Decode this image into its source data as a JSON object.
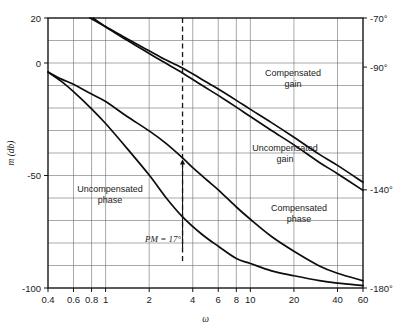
{
  "chart_data": {
    "type": "line",
    "title": "",
    "subtitle": "",
    "xlabel": "ω",
    "ylabel": "m (db)",
    "y2label": "",
    "xscale": "log",
    "xlim": [
      0.4,
      60
    ],
    "ylim": [
      -100,
      20
    ],
    "y2lim": [
      -180,
      -70
    ],
    "grid": true,
    "legend_position": "inline-annotations",
    "x_tick_labels": [
      "0.4",
      "0.6",
      "0.8",
      "1",
      "2",
      "4",
      "6",
      "8",
      "10",
      "20",
      "40",
      "60"
    ],
    "x_tick_values": [
      0.4,
      0.6,
      0.8,
      1,
      2,
      4,
      6,
      8,
      10,
      20,
      40,
      60
    ],
    "x_gridline_values": [
      0.6,
      0.8,
      1,
      2,
      4,
      6,
      8,
      10,
      20,
      40
    ],
    "y_tick_labels": [
      "20",
      "0",
      "-50",
      "-100"
    ],
    "y_tick_values": [
      20,
      0,
      -50,
      -100
    ],
    "y_gridline_values": [
      10,
      0,
      -10,
      -20,
      -30,
      -40,
      -50,
      -60,
      -70,
      -80,
      -90
    ],
    "y2_tick_labels": [
      "-70°",
      "-90°",
      "-140°",
      "-180°"
    ],
    "y2_tick_values": [
      -70,
      -90,
      -140,
      -180
    ],
    "annotations": [
      {
        "name": "compensated-gain",
        "text_line1": "Compensated",
        "text_line2": "gain",
        "x": 293,
        "y": 76
      },
      {
        "name": "uncompensated-gain",
        "text_line1": "Uncompensated",
        "text_line2": "gain",
        "x": 285,
        "y": 151
      },
      {
        "name": "uncompensated-phase",
        "text_line1": "Uncompensated",
        "text_line2": "phase",
        "x": 110,
        "y": 192
      },
      {
        "name": "compensated-phase",
        "text_line1": "Compensated",
        "text_line2": "phase",
        "x": 299,
        "y": 211
      },
      {
        "name": "phase-margin",
        "text_line1": "PM = 17°",
        "text_line2": "",
        "x": 163,
        "y": 242
      }
    ],
    "gain_crossover_omega": 3.4,
    "phase_margin_deg": 17,
    "series": [
      {
        "name": "Compensated gain",
        "axis": "left",
        "points": [
          [
            0.82,
            20
          ],
          [
            1,
            16.2
          ],
          [
            1.3,
            12.0
          ],
          [
            1.8,
            7.0
          ],
          [
            2.4,
            2.6
          ],
          [
            3.4,
            -2.2
          ],
          [
            4.6,
            -7.2
          ],
          [
            6,
            -11.6
          ],
          [
            8,
            -16.6
          ],
          [
            10,
            -20.6
          ],
          [
            14,
            -26.5
          ],
          [
            20,
            -33.0
          ],
          [
            30,
            -40.6
          ],
          [
            40,
            -45.5
          ],
          [
            60,
            -53.0
          ]
        ]
      },
      {
        "name": "Uncompensated gain",
        "axis": "left",
        "points": [
          [
            0.78,
            20
          ],
          [
            1,
            16.0
          ],
          [
            1.3,
            11.4
          ],
          [
            1.8,
            6.0
          ],
          [
            2.4,
            1.2
          ],
          [
            3.4,
            -4.4
          ],
          [
            4.6,
            -9.8
          ],
          [
            6,
            -14.4
          ],
          [
            8,
            -19.6
          ],
          [
            10,
            -23.8
          ],
          [
            14,
            -30.0
          ],
          [
            20,
            -36.4
          ],
          [
            30,
            -44.2
          ],
          [
            40,
            -49.2
          ],
          [
            60,
            -56.6
          ]
        ]
      },
      {
        "name": "Uncompensated phase",
        "axis": "right",
        "points": [
          [
            0.4,
            -92
          ],
          [
            0.5,
            -96
          ],
          [
            0.6,
            -100
          ],
          [
            0.8,
            -107
          ],
          [
            1,
            -113
          ],
          [
            1.4,
            -123
          ],
          [
            2,
            -134
          ],
          [
            2.6,
            -143
          ],
          [
            3.4,
            -151
          ],
          [
            4.6,
            -158
          ],
          [
            6,
            -163
          ],
          [
            8,
            -168
          ],
          [
            10,
            -170
          ],
          [
            14,
            -173
          ],
          [
            20,
            -175
          ],
          [
            30,
            -177
          ],
          [
            40,
            -178
          ],
          [
            60,
            -179
          ]
        ]
      },
      {
        "name": "Compensated phase",
        "axis": "right",
        "points": [
          [
            0.4,
            -92
          ],
          [
            0.5,
            -95
          ],
          [
            0.6,
            -97
          ],
          [
            0.8,
            -101
          ],
          [
            1,
            -104
          ],
          [
            1.4,
            -110
          ],
          [
            2,
            -116
          ],
          [
            2.6,
            -121
          ],
          [
            3.4,
            -127
          ],
          [
            4,
            -131
          ],
          [
            5,
            -136
          ],
          [
            6,
            -140
          ],
          [
            8,
            -147
          ],
          [
            10,
            -152
          ],
          [
            14,
            -159
          ],
          [
            20,
            -165
          ],
          [
            30,
            -171
          ],
          [
            40,
            -174
          ],
          [
            60,
            -177
          ]
        ]
      }
    ]
  },
  "figure": {
    "plot_left_px": 48,
    "plot_right_px": 363,
    "plot_top_px": 18,
    "plot_bottom_px": 288
  }
}
